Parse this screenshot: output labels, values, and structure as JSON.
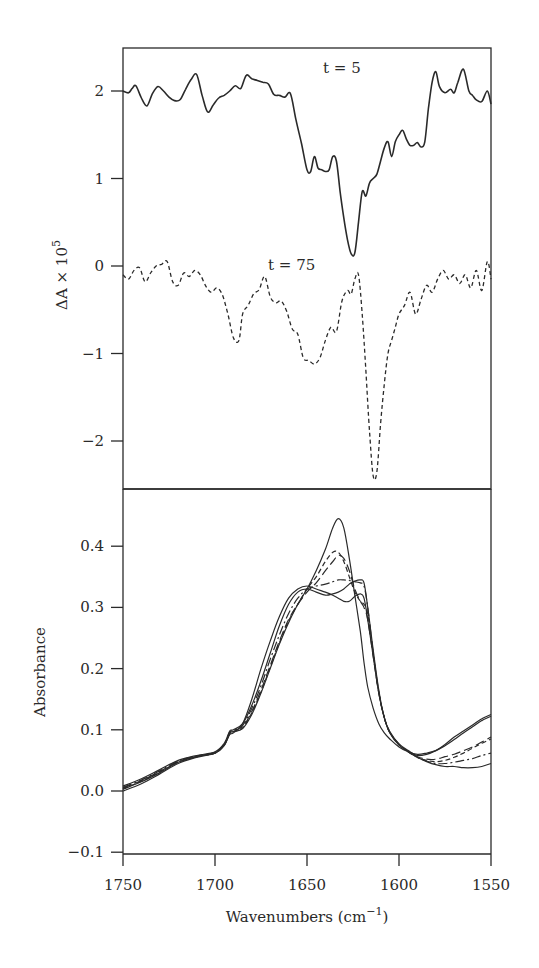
{
  "chart_data": [
    {
      "type": "line",
      "panel": "top",
      "title": "",
      "xlabel": "",
      "ylabel": "ΔA × 10^5",
      "ylabel_parts": {
        "main": "ΔA × 10",
        "sup": "5"
      },
      "xlim": [
        1750,
        1550
      ],
      "ylim": [
        -2.5,
        2.5
      ],
      "yticks": [
        2,
        1,
        0,
        -1,
        -2
      ],
      "ytick_labels": [
        "2",
        "1",
        "0",
        "−1",
        "−2"
      ],
      "grid": false,
      "annotations": [
        {
          "text": "t = 5",
          "x": 1642,
          "y": 2.2
        },
        {
          "text": "t = 75",
          "x": 1656,
          "y": 0.0
        }
      ],
      "series": [
        {
          "name": "t = 5",
          "style": "solid",
          "x": [
            1750,
            1747,
            1745,
            1743,
            1740,
            1737,
            1734,
            1731,
            1728,
            1725,
            1722,
            1719,
            1716,
            1713,
            1710,
            1707,
            1704,
            1701,
            1698,
            1695,
            1692,
            1689,
            1686,
            1683,
            1680,
            1677,
            1674,
            1671,
            1668,
            1665,
            1662,
            1659,
            1656,
            1653,
            1650,
            1648,
            1646,
            1644,
            1642,
            1640,
            1638,
            1636,
            1634,
            1632,
            1630,
            1628,
            1626,
            1624,
            1622,
            1620,
            1618,
            1616,
            1614,
            1612,
            1610,
            1608,
            1606,
            1604,
            1602,
            1600,
            1598,
            1596,
            1594,
            1592,
            1590,
            1588,
            1586,
            1584,
            1582,
            1580,
            1578,
            1575,
            1572,
            1570,
            1568,
            1565,
            1562,
            1560,
            1558,
            1555,
            1552,
            1550
          ],
          "values": [
            2.0,
            1.98,
            2.03,
            2.06,
            1.92,
            1.83,
            1.97,
            2.05,
            2.0,
            1.93,
            1.89,
            1.9,
            2.02,
            2.13,
            2.19,
            1.95,
            1.76,
            1.84,
            1.92,
            1.95,
            2.0,
            2.06,
            2.03,
            2.18,
            2.14,
            2.12,
            2.1,
            2.08,
            1.96,
            1.95,
            1.93,
            1.97,
            1.67,
            1.4,
            1.1,
            1.08,
            1.25,
            1.12,
            1.1,
            1.08,
            1.1,
            1.25,
            1.2,
            0.85,
            0.55,
            0.3,
            0.14,
            0.15,
            0.5,
            0.85,
            0.8,
            0.95,
            1.0,
            1.05,
            1.2,
            1.35,
            1.42,
            1.25,
            1.42,
            1.5,
            1.55,
            1.45,
            1.38,
            1.38,
            1.41,
            1.36,
            1.42,
            1.8,
            2.1,
            2.22,
            2.05,
            1.98,
            2.02,
            1.98,
            2.1,
            2.25,
            2.0,
            1.95,
            1.9,
            1.88,
            2.0,
            1.85
          ]
        },
        {
          "name": "t = 75",
          "style": "dashed",
          "x": [
            1750,
            1747,
            1744,
            1741,
            1738,
            1735,
            1732,
            1729,
            1726,
            1723,
            1720,
            1717,
            1714,
            1711,
            1708,
            1705,
            1702,
            1699,
            1696,
            1693,
            1690,
            1687,
            1685,
            1682,
            1679,
            1676,
            1673,
            1670,
            1667,
            1664,
            1661,
            1658,
            1655,
            1652,
            1649,
            1646,
            1643,
            1640,
            1637,
            1634,
            1631,
            1628,
            1626,
            1624,
            1622,
            1620,
            1618,
            1616,
            1614,
            1612,
            1610,
            1608,
            1606,
            1604,
            1602,
            1600,
            1597,
            1594,
            1591,
            1588,
            1585,
            1582,
            1579,
            1576,
            1573,
            1570,
            1567,
            1564,
            1561,
            1558,
            1555,
            1552,
            1550
          ],
          "values": [
            -0.1,
            -0.15,
            -0.05,
            -0.02,
            -0.18,
            -0.08,
            0.0,
            0.02,
            0.05,
            -0.18,
            -0.22,
            -0.08,
            -0.12,
            -0.05,
            -0.1,
            -0.23,
            -0.3,
            -0.25,
            -0.33,
            -0.55,
            -0.82,
            -0.85,
            -0.55,
            -0.45,
            -0.32,
            -0.27,
            -0.12,
            -0.35,
            -0.42,
            -0.4,
            -0.52,
            -0.72,
            -0.78,
            -1.05,
            -1.08,
            -1.12,
            -1.05,
            -0.85,
            -0.7,
            -0.75,
            -0.4,
            -0.28,
            -0.32,
            -0.15,
            -0.1,
            -0.55,
            -1.2,
            -1.9,
            -2.4,
            -2.35,
            -1.8,
            -1.35,
            -1.0,
            -0.85,
            -0.7,
            -0.55,
            -0.45,
            -0.3,
            -0.55,
            -0.38,
            -0.22,
            -0.3,
            -0.15,
            -0.05,
            -0.15,
            -0.1,
            -0.2,
            -0.1,
            -0.25,
            -0.05,
            -0.28,
            0.05,
            -0.15
          ]
        }
      ]
    },
    {
      "type": "line",
      "panel": "bottom",
      "title": "",
      "xlabel": "Wavenumbers (cm^-1)",
      "xlabel_parts": {
        "main": "Wavenumbers (cm",
        "sup": "−1",
        "end": ")"
      },
      "ylabel": "Absorbance",
      "xlim": [
        1750,
        1550
      ],
      "ylim": [
        -0.1,
        0.47
      ],
      "xticks": [
        1750,
        1700,
        1650,
        1600,
        1550
      ],
      "xtick_labels": [
        "1750",
        "1700",
        "1650",
        "1600",
        "1550"
      ],
      "yticks": [
        0.4,
        0.3,
        0.2,
        0.1,
        0.0,
        -0.1
      ],
      "ytick_labels": [
        "0.4",
        "0.3",
        "0.2",
        "0.1",
        "0.0",
        "−0.1"
      ],
      "grid": false,
      "legend": null,
      "x": [
        1750,
        1740,
        1730,
        1720,
        1710,
        1700,
        1695,
        1692,
        1690,
        1685,
        1680,
        1675,
        1670,
        1665,
        1660,
        1655,
        1650,
        1645,
        1640,
        1636,
        1633,
        1630,
        1627,
        1624,
        1621,
        1619,
        1617,
        1614,
        1611,
        1608,
        1605,
        1600,
        1595,
        1590,
        1585,
        1580,
        1575,
        1570,
        1565,
        1560,
        1555,
        1550
      ],
      "series": [
        {
          "name": "curve-1",
          "style": "solid",
          "values": [
            0.0,
            0.012,
            0.028,
            0.045,
            0.055,
            0.062,
            0.075,
            0.092,
            0.095,
            0.11,
            0.15,
            0.2,
            0.245,
            0.285,
            0.315,
            0.33,
            0.335,
            0.33,
            0.325,
            0.32,
            0.315,
            0.31,
            0.31,
            0.318,
            0.322,
            0.315,
            0.28,
            0.22,
            0.16,
            0.12,
            0.095,
            0.075,
            0.065,
            0.055,
            0.048,
            0.043,
            0.04,
            0.04,
            0.038,
            0.038,
            0.04,
            0.045
          ]
        },
        {
          "name": "curve-2",
          "style": "solid",
          "values": [
            0.008,
            0.02,
            0.035,
            0.05,
            0.058,
            0.064,
            0.078,
            0.098,
            0.1,
            0.11,
            0.14,
            0.18,
            0.225,
            0.27,
            0.305,
            0.325,
            0.33,
            0.325,
            0.32,
            0.322,
            0.325,
            0.33,
            0.338,
            0.343,
            0.345,
            0.34,
            0.3,
            0.23,
            0.165,
            0.12,
            0.097,
            0.077,
            0.066,
            0.058,
            0.06,
            0.066,
            0.076,
            0.088,
            0.098,
            0.108,
            0.118,
            0.125
          ]
        },
        {
          "name": "curve-3",
          "style": "long-dash",
          "values": [
            0.005,
            0.017,
            0.032,
            0.048,
            0.057,
            0.063,
            0.076,
            0.095,
            0.098,
            0.105,
            0.13,
            0.165,
            0.205,
            0.245,
            0.28,
            0.305,
            0.325,
            0.34,
            0.36,
            0.375,
            0.385,
            0.38,
            0.36,
            0.33,
            0.31,
            0.3,
            0.28,
            0.22,
            0.16,
            0.12,
            0.096,
            0.076,
            0.064,
            0.056,
            0.052,
            0.052,
            0.056,
            0.06,
            0.066,
            0.072,
            0.08,
            0.088
          ]
        },
        {
          "name": "curve-4",
          "style": "dash-dot",
          "values": [
            0.006,
            0.018,
            0.033,
            0.049,
            0.057,
            0.063,
            0.077,
            0.096,
            0.099,
            0.107,
            0.135,
            0.172,
            0.215,
            0.255,
            0.29,
            0.315,
            0.33,
            0.335,
            0.338,
            0.342,
            0.345,
            0.345,
            0.344,
            0.342,
            0.34,
            0.335,
            0.3,
            0.225,
            0.162,
            0.12,
            0.096,
            0.076,
            0.064,
            0.055,
            0.049,
            0.045,
            0.045,
            0.047,
            0.05,
            0.053,
            0.058,
            0.062
          ]
        },
        {
          "name": "curve-5",
          "style": "solid",
          "values": [
            0.003,
            0.015,
            0.03,
            0.047,
            0.056,
            0.062,
            0.074,
            0.094,
            0.097,
            0.102,
            0.125,
            0.16,
            0.2,
            0.24,
            0.275,
            0.305,
            0.33,
            0.36,
            0.395,
            0.43,
            0.445,
            0.43,
            0.38,
            0.32,
            0.26,
            0.21,
            0.17,
            0.135,
            0.11,
            0.095,
            0.085,
            0.072,
            0.064,
            0.06,
            0.062,
            0.066,
            0.074,
            0.084,
            0.095,
            0.105,
            0.115,
            0.122
          ]
        },
        {
          "name": "curve-6",
          "style": "short-dash",
          "values": [
            0.004,
            0.016,
            0.031,
            0.047,
            0.056,
            0.062,
            0.075,
            0.094,
            0.097,
            0.103,
            0.128,
            0.162,
            0.202,
            0.242,
            0.278,
            0.305,
            0.33,
            0.35,
            0.375,
            0.39,
            0.39,
            0.375,
            0.35,
            0.325,
            0.31,
            0.305,
            0.29,
            0.225,
            0.162,
            0.12,
            0.096,
            0.076,
            0.064,
            0.055,
            0.05,
            0.048,
            0.05,
            0.055,
            0.062,
            0.07,
            0.078,
            0.085
          ]
        }
      ]
    }
  ]
}
